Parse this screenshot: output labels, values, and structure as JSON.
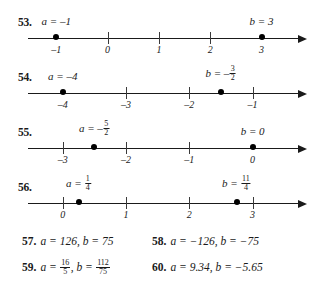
{
  "numberline_exercises": [
    {
      "number": "53.",
      "axis": {
        "min": -1.55,
        "max": 3.75
      },
      "ticks": [
        {
          "value": -1,
          "label": "–1",
          "show_tick": false
        },
        {
          "value": 0,
          "label": "0",
          "show_tick": true
        },
        {
          "value": 1,
          "label": "1",
          "show_tick": true
        },
        {
          "value": 2,
          "label": "2",
          "show_tick": true
        },
        {
          "value": 3,
          "label": "3",
          "show_tick": false
        }
      ],
      "points": [
        {
          "value": -1,
          "var": "a",
          "label_text": "a = –1",
          "label_kind": "plain",
          "num": "",
          "den": ""
        },
        {
          "value": 3,
          "var": "b",
          "label_text": "b = 3",
          "label_kind": "plain",
          "num": "",
          "den": ""
        }
      ]
    },
    {
      "number": "54.",
      "axis": {
        "min": -4.55,
        "max": -0.25
      },
      "ticks": [
        {
          "value": -4,
          "label": "–4",
          "show_tick": false
        },
        {
          "value": -3,
          "label": "–3",
          "show_tick": true
        },
        {
          "value": -2,
          "label": "–2",
          "show_tick": true
        },
        {
          "value": -1,
          "label": "–1",
          "show_tick": true
        }
      ],
      "points": [
        {
          "value": -4,
          "var": "a",
          "label_text": "a = –4",
          "label_kind": "plain",
          "num": "",
          "den": ""
        },
        {
          "value": -1.5,
          "var": "b",
          "label_text": "b = –",
          "label_kind": "frac",
          "num": "3",
          "den": "2"
        }
      ]
    },
    {
      "number": "55.",
      "axis": {
        "min": -3.55,
        "max": 0.75
      },
      "ticks": [
        {
          "value": -3,
          "label": "–3",
          "show_tick": true
        },
        {
          "value": -2,
          "label": "–2",
          "show_tick": true
        },
        {
          "value": -1,
          "label": "–1",
          "show_tick": true
        },
        {
          "value": 0,
          "label": "0",
          "show_tick": false
        }
      ],
      "points": [
        {
          "value": -2.5,
          "var": "a",
          "label_text": "a = –",
          "label_kind": "frac",
          "num": "5",
          "den": "2"
        },
        {
          "value": 0,
          "var": "b",
          "label_text": "b = 0",
          "label_kind": "plain",
          "num": "",
          "den": ""
        }
      ]
    },
    {
      "number": "56.",
      "axis": {
        "min": -0.55,
        "max": 3.75
      },
      "ticks": [
        {
          "value": 0,
          "label": "0",
          "show_tick": true
        },
        {
          "value": 1,
          "label": "1",
          "show_tick": true
        },
        {
          "value": 2,
          "label": "2",
          "show_tick": true
        },
        {
          "value": 3,
          "label": "3",
          "show_tick": true
        }
      ],
      "points": [
        {
          "value": 0.25,
          "var": "a",
          "label_text": "a = ",
          "label_kind": "frac",
          "num": "1",
          "den": "4"
        },
        {
          "value": 2.75,
          "var": "b",
          "label_text": "b = ",
          "label_kind": "frac",
          "num": "11",
          "den": "4"
        }
      ]
    }
  ],
  "text_exercises": [
    {
      "number": "57.",
      "kind": "plain",
      "text": "a = 126, b = 75"
    },
    {
      "number": "58.",
      "kind": "plain",
      "text": "a = −126, b = −75"
    },
    {
      "number": "59.",
      "kind": "fraction",
      "prefix": "a = ",
      "frac1_num": "16",
      "frac1_den": "5",
      "middle": ", b = ",
      "frac2_num": "112",
      "frac2_den": "75",
      "suffix": ""
    },
    {
      "number": "60.",
      "kind": "plain",
      "text": "a = 9.34, b = −5.65"
    }
  ],
  "colors": {
    "ink": "#1a1a1a",
    "tick": "#3a3a3a",
    "background": "#ffffff"
  }
}
